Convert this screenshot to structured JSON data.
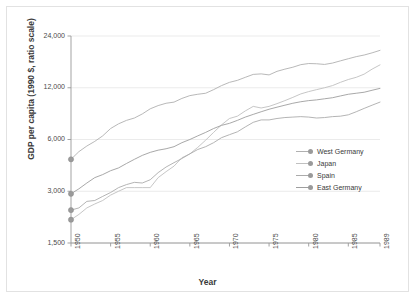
{
  "chart_data": {
    "type": "line",
    "title": "",
    "xlabel": "Year",
    "ylabel": "GDP per capita (1990 $, ratio scale)",
    "scale": "log",
    "grid": true,
    "legend_position": "inside-right",
    "xlim": [
      1950,
      1989
    ],
    "ylim": [
      1500,
      24000
    ],
    "ytick_labels": [
      "24,000",
      "12,000",
      "6,000",
      "3,000",
      "1,500"
    ],
    "ytick_values": [
      24000,
      12000,
      6000,
      3000,
      1500
    ],
    "xtick_labels": [
      "1950",
      "1955",
      "1960",
      "1965",
      "1970",
      "1975",
      "1980",
      "1985",
      "1989"
    ],
    "xtick_values": [
      1950,
      1955,
      1960,
      1965,
      1970,
      1975,
      1980,
      1985,
      1989
    ],
    "x": [
      1950,
      1951,
      1952,
      1953,
      1954,
      1955,
      1956,
      1957,
      1958,
      1959,
      1960,
      1961,
      1962,
      1963,
      1964,
      1965,
      1966,
      1967,
      1968,
      1969,
      1970,
      1971,
      1972,
      1973,
      1974,
      1975,
      1976,
      1977,
      1978,
      1979,
      1980,
      1981,
      1982,
      1983,
      1984,
      1985,
      1986,
      1987,
      1988,
      1989
    ],
    "series": [
      {
        "name": "West Germany",
        "color": "#b0b0b0",
        "values": [
          4600,
          5100,
          5500,
          5850,
          6300,
          6950,
          7400,
          7750,
          8000,
          8450,
          9050,
          9450,
          9750,
          9900,
          10400,
          10800,
          11000,
          11150,
          11700,
          12350,
          12900,
          13250,
          13800,
          14350,
          14450,
          14250,
          14950,
          15400,
          15800,
          16350,
          16600,
          16550,
          16400,
          16700,
          17200,
          17700,
          18200,
          18600,
          19150,
          19800
        ],
        "start_value": 4600,
        "end_value": 19800
      },
      {
        "name": "Japan",
        "color": "#c0c0c0",
        "values": [
          2050,
          2200,
          2400,
          2530,
          2650,
          2850,
          3000,
          3150,
          3150,
          3150,
          3150,
          3600,
          3900,
          4200,
          4700,
          4950,
          5400,
          5950,
          6600,
          7300,
          7950,
          8200,
          8800,
          9350,
          9150,
          9350,
          9700,
          10100,
          10550,
          11050,
          11400,
          11700,
          12000,
          12350,
          12900,
          13400,
          13800,
          14400,
          15400,
          16300
        ],
        "start_value": 2050,
        "end_value": 16300
      },
      {
        "name": "Spain",
        "color": "#ababab",
        "values": [
          2330,
          2400,
          2620,
          2650,
          2800,
          2950,
          3150,
          3280,
          3380,
          3350,
          3500,
          3850,
          4150,
          4400,
          4650,
          4950,
          5250,
          5450,
          5750,
          6150,
          6400,
          6650,
          7100,
          7550,
          7800,
          7800,
          7950,
          8050,
          8100,
          8150,
          8100,
          8000,
          8050,
          8150,
          8200,
          8350,
          8700,
          9100,
          9500,
          9900
        ],
        "start_value": 2330,
        "end_value": 9900
      },
      {
        "name": "East Germany",
        "color": "#9e9e9e",
        "values": [
          2900,
          3100,
          3350,
          3600,
          3750,
          3950,
          4100,
          4350,
          4600,
          4850,
          5050,
          5200,
          5300,
          5450,
          5750,
          6000,
          6300,
          6600,
          6950,
          7250,
          7450,
          7750,
          8100,
          8400,
          8700,
          9000,
          9250,
          9500,
          9750,
          9950,
          10100,
          10200,
          10350,
          10500,
          10750,
          11000,
          11150,
          11300,
          11600,
          11900
        ],
        "start_value": 2900,
        "end_value": 11900
      }
    ]
  },
  "legend": {
    "items": [
      {
        "label": "West Germany"
      },
      {
        "label": "Japan"
      },
      {
        "label": "Spain"
      },
      {
        "label": "East Germany"
      }
    ]
  },
  "axes": {
    "y_title": "GDP per capita (1990 $, ratio scale)",
    "x_title": "Year"
  }
}
